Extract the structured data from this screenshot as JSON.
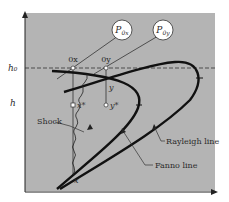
{
  "diagram": {
    "type": "h-s diagram",
    "colors": {
      "plot_background": "#b4b4b4",
      "curve": "#111111",
      "axis": "#222222",
      "marker_fill": "#ffffff"
    },
    "axes": {
      "y_label": "h",
      "y_reference_label": "h₀",
      "x_label": ""
    },
    "points": {
      "ox": "0x",
      "oy": "0y",
      "x_star": "x*",
      "y_star": "y*",
      "y": "y",
      "x": "x"
    },
    "pressure_bubbles": {
      "p0x": "P0x",
      "p0y": "P0y"
    },
    "annotations": {
      "shock": "Shock",
      "rayleigh": "Rayleigh line",
      "fanno": "Fanno line"
    }
  }
}
